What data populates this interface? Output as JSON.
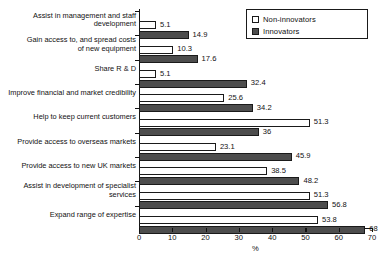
{
  "chart_data": {
    "type": "bar",
    "orientation": "horizontal",
    "title": "",
    "xlabel": "%",
    "ylabel": "",
    "xlim": [
      0,
      70
    ],
    "xticks": [
      0,
      10,
      20,
      30,
      40,
      50,
      60,
      70
    ],
    "grid": false,
    "legend_position": "top-right",
    "categories": [
      "Assist in management and staff development",
      "Gain access to, and spread costs of new equipment",
      "Share R & D",
      "Improve financial and market credibility",
      "Help to keep current customers",
      "Provide access to overseas markets",
      "Provide access to new UK markets",
      "Assist in development of specialist services",
      "Expand range of expertise"
    ],
    "category_lines": [
      [
        "Assist in management and staff",
        "development"
      ],
      [
        "Gain access to, and spread costs",
        "of new equipment"
      ],
      [
        "Share R & D"
      ],
      [
        "Improve financial and market credibility"
      ],
      [
        "Help to keep current customers"
      ],
      [
        "Provide access to overseas markets"
      ],
      [
        "Provide access to new UK markets"
      ],
      [
        "Assist in development of specialist",
        "services"
      ],
      [
        "Expand range of expertise"
      ]
    ],
    "series": [
      {
        "name": "Non-innovators",
        "color": "#ffffff",
        "values": [
          5.1,
          10.3,
          5.1,
          25.6,
          51.3,
          23.1,
          38.5,
          51.3,
          53.8
        ],
        "labels": [
          "5.1",
          "10.3",
          "5.1",
          "25.6",
          "51.3",
          "23.1",
          "38.5",
          "51.3",
          "53.8"
        ]
      },
      {
        "name": "Innovators",
        "color": "#4d4d4d",
        "values": [
          14.9,
          17.6,
          32.4,
          34.2,
          36,
          45.9,
          48.2,
          56.8,
          68
        ],
        "labels": [
          "14.9",
          "17.6",
          "32.4",
          "34.2",
          "36",
          "45.9",
          "48.2",
          "56.8",
          "68"
        ]
      }
    ]
  },
  "legend": {
    "items": [
      {
        "label": "Non-innovators",
        "swatch": "hollow-square-swatch"
      },
      {
        "label": "Innovators",
        "swatch": "filled-square-swatch"
      }
    ]
  },
  "axis": {
    "x_title": "%",
    "tick_labels": [
      "0",
      "10",
      "20",
      "30",
      "40",
      "50",
      "60",
      "70"
    ]
  }
}
